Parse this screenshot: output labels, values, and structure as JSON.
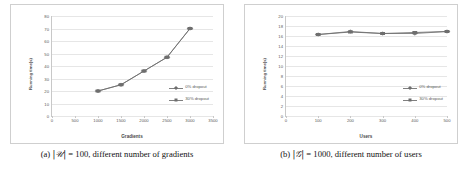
{
  "figure": {
    "subfigures": [
      {
        "caption_prefix": "(a)",
        "caption_symbol": "|𝒰|",
        "caption_rest": "= 100, different number of gradients",
        "caption_full": "(a) |𝒰| = 100, different number of gradients"
      },
      {
        "caption_prefix": "(b)",
        "caption_symbol": "|𝒢|",
        "caption_rest": "= 1000, different number of users",
        "caption_full": "(b) |𝒢| = 1000, different number of users"
      }
    ]
  },
  "colors": {
    "series_0_percent": "#7f7f7f",
    "series_30_percent": "#6e6e6e",
    "gridline": "#e6e6e6",
    "axis": "#c8c8c8",
    "frame_border": "#cfcfcf",
    "tick_text": "#5a5a5a",
    "axis_title_text": "#4a4a4a"
  },
  "chart_data": [
    {
      "type": "line",
      "title": "",
      "xlabel": "Gradients",
      "ylabel": "Running time(s)",
      "x": [
        1000,
        1500,
        2000,
        2500,
        3000
      ],
      "xlim": [
        0,
        3500
      ],
      "ylim": [
        0,
        80
      ],
      "xticks": [
        0,
        500,
        1000,
        1500,
        2000,
        2500,
        3000,
        3500
      ],
      "yticks": [
        0,
        10,
        20,
        30,
        40,
        50,
        60,
        70,
        80
      ],
      "grid": true,
      "legend_position": "right-inside-lower",
      "series": [
        {
          "name": "0% dropout",
          "marker": "diamond",
          "values": [
            20,
            25,
            36,
            47,
            70
          ]
        },
        {
          "name": "30% dropout",
          "marker": "square",
          "values": [
            20,
            25,
            36,
            47,
            70
          ]
        }
      ]
    },
    {
      "type": "line",
      "title": "",
      "xlabel": "Users",
      "ylabel": "Running time(s)",
      "x": [
        100,
        200,
        300,
        400,
        500
      ],
      "xlim": [
        0,
        500
      ],
      "ylim": [
        0,
        20
      ],
      "xticks": [
        0,
        100,
        200,
        300,
        400,
        500
      ],
      "yticks": [
        0,
        2,
        4,
        6,
        8,
        10,
        12,
        14,
        16,
        18,
        20
      ],
      "grid": true,
      "legend_position": "right-inside-lower",
      "series": [
        {
          "name": "0% dropout",
          "marker": "diamond",
          "values": [
            16.3,
            16.9,
            16.5,
            16.5,
            16.9
          ]
        },
        {
          "name": "30% dropout",
          "marker": "square",
          "values": [
            16.3,
            16.8,
            16.5,
            16.7,
            16.9
          ]
        }
      ]
    }
  ]
}
